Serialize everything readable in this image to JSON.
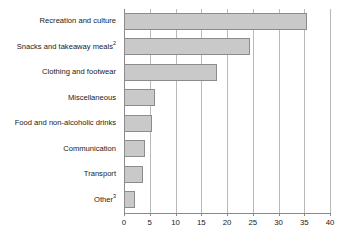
{
  "chart_data": {
    "type": "bar",
    "orientation": "horizontal",
    "title": "",
    "xlabel": "",
    "ylabel": "",
    "xlim": [
      0,
      40
    ],
    "xticks": [
      0,
      5,
      10,
      15,
      20,
      25,
      30,
      35,
      40
    ],
    "xtick_labels": [
      "0",
      "5",
      "10",
      "15",
      "20",
      "25",
      "30",
      "35",
      "40"
    ],
    "grid": true,
    "legend": false,
    "categories": [
      "Recreation and culture",
      "Snacks and takeaway meals",
      "Clothing and footwear",
      "Miscellaneous",
      "Food and non-alcoholic drinks",
      "Communication",
      "Transport",
      "Other"
    ],
    "category_footnotes": [
      "",
      "2",
      "",
      "",
      "",
      "",
      "",
      "3"
    ],
    "values": [
      35.5,
      24.4,
      18.0,
      6.0,
      5.5,
      4.1,
      3.7,
      2.2
    ],
    "bar_fill_color": "#c9c9c9",
    "bar_border_color": "#8c8c8c",
    "gridline_color": "#b9b9b9",
    "axis_color": "#8a8a8a"
  },
  "title_remnant": ""
}
